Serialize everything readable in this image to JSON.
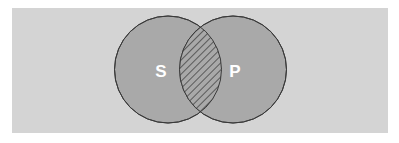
{
  "diagram": {
    "type": "venn",
    "canvas": {
      "width": 399,
      "height": 143,
      "background": "#ffffff"
    },
    "panel": {
      "x": 12,
      "y": 8,
      "width": 376,
      "height": 125,
      "fill": "#d4d4d4"
    },
    "circle_style": {
      "fill": "#a9a9a9",
      "stroke": "#3a3a3a",
      "stroke_width": 1
    },
    "sets": [
      {
        "id": "S",
        "label": "S",
        "cx": 168,
        "cy": 69.5,
        "r": 53.5,
        "label_x": 161,
        "label_y": 77
      },
      {
        "id": "P",
        "label": "P",
        "cx": 233,
        "cy": 69.5,
        "r": 53.5,
        "label_x": 235,
        "label_y": 77
      }
    ],
    "intersection": {
      "sets": [
        "S",
        "P"
      ],
      "shading": "diagonal-hatch",
      "hatch_spacing": 5,
      "hatch_color": "#2e2e2e",
      "fill": "#a9a9a9"
    }
  }
}
